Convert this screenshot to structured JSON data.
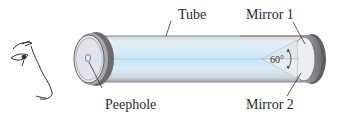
{
  "diagram": {
    "type": "labeled-illustration",
    "labels": {
      "tube": "Tube",
      "mirror1": "Mirror 1",
      "mirror2": "Mirror 2",
      "peephole": "Peephole",
      "angle": "60°"
    },
    "elements": [
      "eye-face-profile",
      "tube",
      "peephole-end-cap",
      "far-end-cap",
      "mirror-1",
      "mirror-2",
      "angle-arc"
    ],
    "colors": {
      "tube_fill": "#d9ecf7",
      "tube_stripe": "#bfe0f2",
      "tube_edge_top": "#c96a6a",
      "cap_rim": "#7a7a7a",
      "cap_face": "#e9e9ec",
      "mirror": "#e6eaee",
      "leader_line": "#333333",
      "text": "#2a2a2a"
    }
  }
}
